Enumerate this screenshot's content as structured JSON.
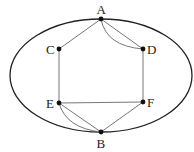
{
  "diagram": {
    "type": "graph",
    "boundary": {
      "shape": "ellipse",
      "cx": 101,
      "cy": 75.5,
      "rx": 91,
      "ry": 56.5,
      "color": "#222222"
    },
    "nodes": [
      {
        "id": "A",
        "label": "A",
        "x": 101,
        "y": 19
      },
      {
        "id": "C",
        "label": "C",
        "x": 59,
        "y": 49
      },
      {
        "id": "D",
        "label": "D",
        "x": 143,
        "y": 49
      },
      {
        "id": "E",
        "label": "E",
        "x": 59,
        "y": 103
      },
      {
        "id": "F",
        "label": "F",
        "x": 143,
        "y": 102
      },
      {
        "id": "B",
        "label": "B",
        "x": 101,
        "y": 132
      }
    ],
    "edges": [
      {
        "from": "A",
        "to": "C",
        "style": "straight"
      },
      {
        "from": "A",
        "to": "D",
        "style": "straight"
      },
      {
        "from": "A",
        "to": "D",
        "style": "curved"
      },
      {
        "from": "C",
        "to": "E",
        "style": "straight"
      },
      {
        "from": "D",
        "to": "F",
        "style": "straight"
      },
      {
        "from": "E",
        "to": "F",
        "style": "straight"
      },
      {
        "from": "E",
        "to": "B",
        "style": "straight"
      },
      {
        "from": "E",
        "to": "B",
        "style": "curved"
      },
      {
        "from": "F",
        "to": "B",
        "style": "straight"
      }
    ],
    "edge_color": "#777777",
    "node_color": "#111111"
  }
}
